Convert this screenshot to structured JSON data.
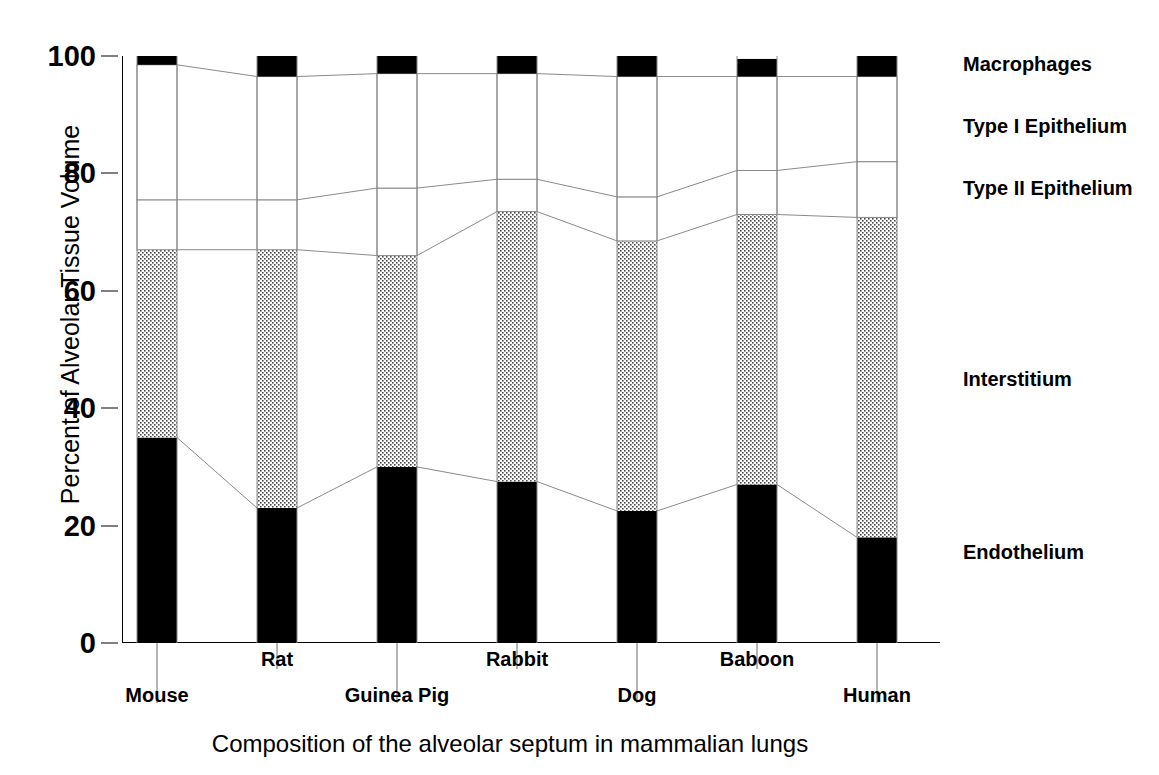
{
  "chart_data": {
    "type": "bar",
    "subtype": "stacked-bar-100pct",
    "title": "",
    "xlabel": "Composition of the alveolar septum in mammalian lungs",
    "ylabel": "Percent of Alveolar Tissue Volume",
    "ylim": [
      0,
      100
    ],
    "yticks": [
      0,
      20,
      40,
      60,
      80,
      100
    ],
    "ytick_labels": [
      "0",
      "20",
      "40",
      "60",
      "80",
      "100"
    ],
    "grid": false,
    "legend_position": "right-outside",
    "categories": [
      "Mouse",
      "Rat",
      "Guinea Pig",
      "Rabbit",
      "Dog",
      "Baboon",
      "Human"
    ],
    "series": [
      {
        "name": "Endothelium",
        "fill": "solid-black",
        "values": [
          35.0,
          23.0,
          30.0,
          27.5,
          22.5,
          27.0,
          18.0
        ]
      },
      {
        "name": "Interstitium",
        "fill": "dotted-stipple",
        "values": [
          32.0,
          44.0,
          36.0,
          46.0,
          46.0,
          46.0,
          54.5
        ]
      },
      {
        "name": "Type II Epithelium",
        "fill": "white",
        "values": [
          8.5,
          8.5,
          11.5,
          5.5,
          7.5,
          7.5,
          9.5
        ]
      },
      {
        "name": "Type I Epithelium",
        "fill": "white",
        "values": [
          23.0,
          21.0,
          19.5,
          18.0,
          20.5,
          16.0,
          14.5
        ]
      },
      {
        "name": "Macrophages",
        "fill": "solid-black",
        "values": [
          1.5,
          3.5,
          3.0,
          3.0,
          3.5,
          3.0,
          3.5
        ]
      }
    ],
    "cumulative_tops": {
      "Endothelium": [
        35.0,
        23.0,
        30.0,
        27.5,
        22.5,
        27.0,
        18.0
      ],
      "Interstitium": [
        67.0,
        67.0,
        66.0,
        73.5,
        68.5,
        73.0,
        72.5
      ],
      "Type II Epithelium": [
        75.5,
        75.5,
        77.5,
        79.0,
        76.0,
        80.5,
        82.0
      ],
      "Type I Epithelium": [
        98.5,
        96.5,
        97.0,
        97.0,
        96.5,
        96.5,
        96.5
      ],
      "Macrophages": [
        100.0,
        100.0,
        100.0,
        100.0,
        100.0,
        100.0,
        100.0
      ]
    }
  },
  "axis": {
    "y_title": "Percent of Alveolar Tissue Volume",
    "x_title": "Composition of the alveolar septum in mammalian lungs",
    "y_ticks": [
      "100",
      "80",
      "60",
      "40",
      "20",
      "0"
    ]
  },
  "x_categories": [
    {
      "label": "Mouse",
      "row": "lower"
    },
    {
      "label": "Rat",
      "row": "upper"
    },
    {
      "label": "Guinea Pig",
      "row": "lower"
    },
    {
      "label": "Rabbit",
      "row": "upper"
    },
    {
      "label": "Dog",
      "row": "lower"
    },
    {
      "label": "Baboon",
      "row": "upper"
    },
    {
      "label": "Human",
      "row": "lower"
    }
  ],
  "series_labels": [
    {
      "name": "Macrophages",
      "at_percent": 98.6
    },
    {
      "name": "Type I Epithelium",
      "at_percent": 88.0
    },
    {
      "name": "Type II Epithelium",
      "at_percent": 77.5
    },
    {
      "name": "Interstitium",
      "at_percent": 45.0
    },
    {
      "name": "Endothelium",
      "at_percent": 15.5
    }
  ],
  "colors": {
    "ink": "#000000",
    "background": "#ffffff",
    "connector_line": "#8a8a8a",
    "stipple_dot": "#4a4a4a"
  }
}
